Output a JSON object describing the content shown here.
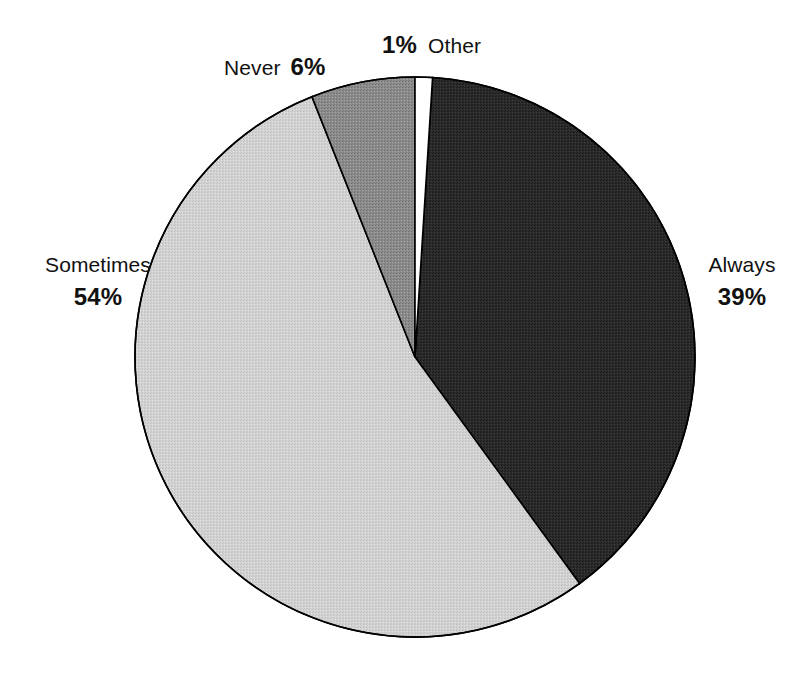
{
  "chart_data": {
    "type": "pie",
    "title": "",
    "subtitle": "",
    "xlabel": "",
    "ylabel": "",
    "legend_position": "none",
    "grid": false,
    "units": "percent",
    "start_angle_deg": 0,
    "direction": "clockwise",
    "categories": [
      "Other",
      "Always",
      "Sometimes",
      "Never"
    ],
    "values": [
      1,
      39,
      54,
      6
    ],
    "labels": [
      "1%",
      "39%",
      "54%",
      "6%"
    ],
    "slices": [
      {
        "name": "Other",
        "label": "Other",
        "value": 1,
        "value_label": "1%",
        "color": "#ffffff",
        "stroke": "#000000",
        "start_deg": 0,
        "end_deg": 3.6,
        "callout": "top"
      },
      {
        "name": "Always",
        "label": "Always",
        "value": 39,
        "value_label": "39%",
        "color": "#2b2b2b",
        "stroke": "#000000",
        "start_deg": 3.6,
        "end_deg": 144.0,
        "callout": "right"
      },
      {
        "name": "Sometimes",
        "label": "Sometimes",
        "value": 54,
        "value_label": "54%",
        "color": "#cfcfcf",
        "stroke": "#000000",
        "start_deg": 144.0,
        "end_deg": 338.4,
        "callout": "left"
      },
      {
        "name": "Never",
        "label": "Never",
        "value": 6,
        "value_label": "6%",
        "color": "#8c8c8c",
        "stroke": "#000000",
        "start_deg": 338.4,
        "end_deg": 360.0,
        "callout": "upper-left"
      }
    ]
  },
  "geometry": {
    "center_x": 415,
    "center_y": 357,
    "radius": 280
  },
  "labels": {
    "other": {
      "name": "Other",
      "pct": "1%"
    },
    "never": {
      "name": "Never",
      "pct": "6%"
    },
    "sometimes": {
      "name": "Sometimes",
      "pct": "54%"
    },
    "always": {
      "name": "Always",
      "pct": "39%"
    }
  },
  "colors": {
    "background": "#ffffff",
    "text": "#111111",
    "outline": "#000000",
    "slice_other": "#ffffff",
    "slice_always": "#2b2b2b",
    "slice_sometimes": "#cfcfcf",
    "slice_never": "#8c8c8c"
  }
}
